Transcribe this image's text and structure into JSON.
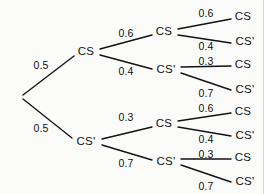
{
  "figure": {
    "kind": "probability-tree-diagram",
    "stages": 3,
    "background_color": "#fbfbfa",
    "ink_color": "#121212"
  },
  "nodes": {
    "root": {
      "label": "",
      "x": 21,
      "y": 97
    },
    "s1_cs": {
      "label": "CS",
      "x": 86,
      "y": 52
    },
    "s1_csp": {
      "label": "CS'",
      "x": 86,
      "y": 142
    },
    "s2_cs_cs": {
      "label": "CS",
      "x": 164,
      "y": 32
    },
    "s2_cs_csp": {
      "label": "CS'",
      "x": 166,
      "y": 70
    },
    "s2_csp_cs": {
      "label": "CS",
      "x": 164,
      "y": 124
    },
    "s2_csp_csp": {
      "label": "CS'",
      "x": 166,
      "y": 162
    },
    "leaf_1": {
      "label": "CS",
      "x": 243,
      "y": 17
    },
    "leaf_2": {
      "label": "CS'",
      "x": 245,
      "y": 42
    },
    "leaf_3": {
      "label": "CS",
      "x": 243,
      "y": 65
    },
    "leaf_4": {
      "label": "CS'",
      "x": 245,
      "y": 90
    },
    "leaf_5": {
      "label": "CS",
      "x": 243,
      "y": 112
    },
    "leaf_6": {
      "label": "CS'",
      "x": 245,
      "y": 136
    },
    "leaf_7": {
      "label": "CS",
      "x": 243,
      "y": 158
    },
    "leaf_8": {
      "label": "CS'",
      "x": 245,
      "y": 182
    }
  },
  "edges": [
    {
      "name": "root-to-s1-cs",
      "x1": 23,
      "y1": 95,
      "x2": 74,
      "y2": 56
    },
    {
      "name": "root-to-s1-csp",
      "x1": 23,
      "y1": 99,
      "x2": 72,
      "y2": 138
    },
    {
      "name": "s1-cs-to-s2-cs",
      "x1": 100,
      "y1": 49,
      "x2": 152,
      "y2": 35
    },
    {
      "name": "s1-cs-to-s2-csp",
      "x1": 100,
      "y1": 55,
      "x2": 152,
      "y2": 69
    },
    {
      "name": "s1-csp-to-s2-cs",
      "x1": 102,
      "y1": 139,
      "x2": 152,
      "y2": 127
    },
    {
      "name": "s1-csp-to-s2-csp",
      "x1": 102,
      "y1": 145,
      "x2": 152,
      "y2": 160
    },
    {
      "name": "s2-cs-cs-to-leaf1",
      "x1": 178,
      "y1": 29,
      "x2": 231,
      "y2": 19
    },
    {
      "name": "s2-cs-cs-to-leaf2",
      "x1": 178,
      "y1": 35,
      "x2": 231,
      "y2": 43
    },
    {
      "name": "s2-cs-csp-to-leaf3",
      "x1": 181,
      "y1": 67,
      "x2": 231,
      "y2": 66
    },
    {
      "name": "s2-cs-csp-to-leaf4",
      "x1": 181,
      "y1": 73,
      "x2": 231,
      "y2": 90
    },
    {
      "name": "s2-csp-cs-to-leaf5",
      "x1": 178,
      "y1": 121,
      "x2": 231,
      "y2": 113
    },
    {
      "name": "s2-csp-cs-to-leaf6",
      "x1": 178,
      "y1": 127,
      "x2": 231,
      "y2": 136
    },
    {
      "name": "s2-csp-csp-to-leaf7",
      "x1": 181,
      "y1": 159,
      "x2": 231,
      "y2": 159
    },
    {
      "name": "s2-csp-csp-to-leaf8",
      "x1": 181,
      "y1": 165,
      "x2": 231,
      "y2": 182
    }
  ],
  "probabilities": {
    "stage1_upper": {
      "value": "0.5",
      "x": 41,
      "y": 65
    },
    "stage1_lower": {
      "value": "0.5",
      "x": 41,
      "y": 128
    },
    "stage2_cs_upper": {
      "value": "0.6",
      "x": 126,
      "y": 33
    },
    "stage2_cs_lower": {
      "value": "0.4",
      "x": 126,
      "y": 71
    },
    "stage2_csp_upper": {
      "value": "0.3",
      "x": 126,
      "y": 117
    },
    "stage2_csp_lower": {
      "value": "0.7",
      "x": 126,
      "y": 163
    },
    "stage3_b1_upper": {
      "value": "0.6",
      "x": 206,
      "y": 13
    },
    "stage3_b1_lower": {
      "value": "0.4",
      "x": 206,
      "y": 46
    },
    "stage3_b2_upper": {
      "value": "0.3",
      "x": 206,
      "y": 61
    },
    "stage3_b2_lower": {
      "value": "0.7",
      "x": 206,
      "y": 93
    },
    "stage3_b3_upper": {
      "value": "0.6",
      "x": 206,
      "y": 108
    },
    "stage3_b3_lower": {
      "value": "0.4",
      "x": 206,
      "y": 139
    },
    "stage3_b4_upper": {
      "value": "0.3",
      "x": 206,
      "y": 154
    },
    "stage3_b4_lower": {
      "value": "0.7",
      "x": 206,
      "y": 186
    }
  },
  "chart_data": {
    "type": "tree",
    "title": "",
    "stages": 3,
    "node_labels": [
      "CS",
      "CS'"
    ],
    "stage_1": {
      "branches": [
        {
          "label": "CS",
          "probability": 0.5
        },
        {
          "label": "CS'",
          "probability": 0.5
        }
      ]
    },
    "stage_2": {
      "from_CS": [
        {
          "label": "CS",
          "probability": 0.6
        },
        {
          "label": "CS'",
          "probability": 0.4
        }
      ],
      "from_CS_prime": [
        {
          "label": "CS",
          "probability": 0.3
        },
        {
          "label": "CS'",
          "probability": 0.7
        }
      ]
    },
    "stage_3": {
      "from_CS_CS": [
        {
          "label": "CS",
          "probability": 0.6
        },
        {
          "label": "CS'",
          "probability": 0.4
        }
      ],
      "from_CS_CSprime": [
        {
          "label": "CS",
          "probability": 0.3
        },
        {
          "label": "CS'",
          "probability": 0.7
        }
      ],
      "from_CSprime_CS": [
        {
          "label": "CS",
          "probability": 0.6
        },
        {
          "label": "CS'",
          "probability": 0.4
        }
      ],
      "from_CSprime_CSprime": [
        {
          "label": "CS",
          "probability": 0.3
        },
        {
          "label": "CS'",
          "probability": 0.7
        }
      ]
    },
    "paths": [
      {
        "sequence": [
          "CS",
          "CS",
          "CS"
        ],
        "probabilities": [
          0.5,
          0.6,
          0.6
        ]
      },
      {
        "sequence": [
          "CS",
          "CS",
          "CS'"
        ],
        "probabilities": [
          0.5,
          0.6,
          0.4
        ]
      },
      {
        "sequence": [
          "CS",
          "CS'",
          "CS"
        ],
        "probabilities": [
          0.5,
          0.4,
          0.3
        ]
      },
      {
        "sequence": [
          "CS",
          "CS'",
          "CS'"
        ],
        "probabilities": [
          0.5,
          0.4,
          0.7
        ]
      },
      {
        "sequence": [
          "CS'",
          "CS",
          "CS"
        ],
        "probabilities": [
          0.5,
          0.3,
          0.6
        ]
      },
      {
        "sequence": [
          "CS'",
          "CS",
          "CS'"
        ],
        "probabilities": [
          0.5,
          0.3,
          0.4
        ]
      },
      {
        "sequence": [
          "CS'",
          "CS'",
          "CS"
        ],
        "probabilities": [
          0.5,
          0.7,
          0.3
        ]
      },
      {
        "sequence": [
          "CS'",
          "CS'",
          "CS'"
        ],
        "probabilities": [
          0.5,
          0.7,
          0.7
        ]
      }
    ]
  }
}
